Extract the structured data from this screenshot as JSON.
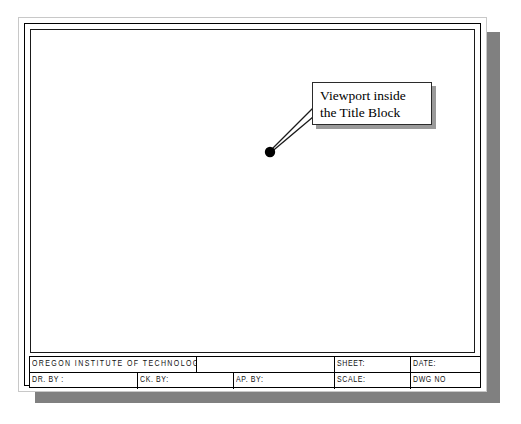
{
  "document": {
    "kind": "cad-drawing-sheet",
    "background_color": "#ffffff",
    "sheet_color": "#ffffff",
    "shadow_color": "#808080",
    "line_color": "#000000"
  },
  "callout": {
    "line1": "Viewport inside",
    "line2": "the Title Block",
    "border_color": "#2b2b2b",
    "shadow_color": "#9a9a9a"
  },
  "leader": {
    "dot_color": "#000000",
    "line_color": "#1a1a1a",
    "dot_x": 270,
    "dot_y": 152
  },
  "title_block": {
    "top_row": [
      {
        "label": "OREGON INSTITUTE OF TECHNOLOGY",
        "x": 0,
        "w": 167
      },
      {
        "label": "",
        "x": 167,
        "w": 138
      },
      {
        "label": "SHEET:",
        "x": 305,
        "w": 76
      },
      {
        "label": "DATE:",
        "x": 381,
        "w": 71
      }
    ],
    "bottom_row": [
      {
        "label": "DR. BY :",
        "x": 0,
        "w": 108
      },
      {
        "label": "CK. BY:",
        "x": 108,
        "w": 96
      },
      {
        "label": "AP. BY:",
        "x": 204,
        "w": 101
      },
      {
        "label": "SCALE:",
        "x": 305,
        "w": 76
      },
      {
        "label": "DWG NO",
        "x": 381,
        "w": 71
      }
    ]
  }
}
